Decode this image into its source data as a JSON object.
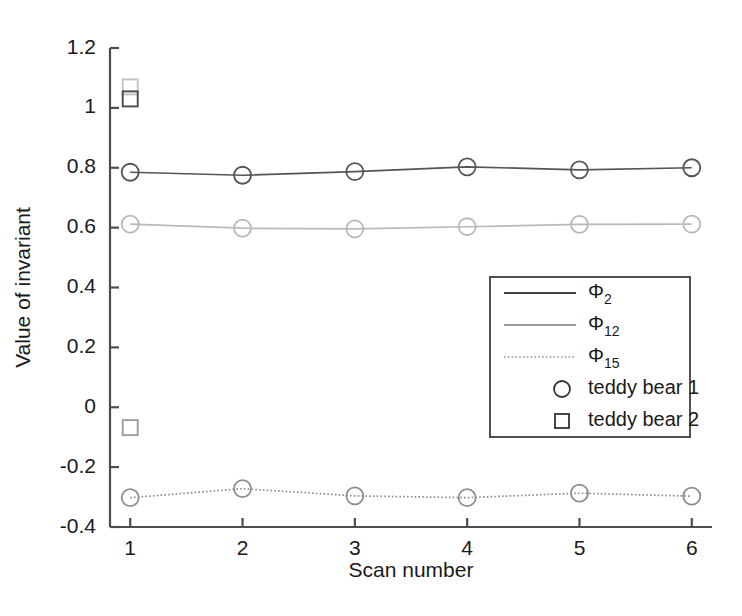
{
  "chart_data": {
    "type": "line",
    "title": "",
    "xlabel": "Scan number",
    "ylabel": "Value of invariant",
    "x": [
      1,
      2,
      3,
      4,
      5,
      6
    ],
    "xticklabels": [
      "1",
      "2",
      "3",
      "4",
      "5",
      "6"
    ],
    "yticklabels": [
      "1.2",
      "1",
      "0.8",
      "0.6",
      "0.4",
      "0.2",
      "0",
      "-0.2",
      "-0.4"
    ],
    "yticks": [
      1.2,
      1.0,
      0.8,
      0.6,
      0.4,
      0.2,
      0,
      -0.2,
      -0.4
    ],
    "xlim": [
      0.82,
      6.18
    ],
    "ylim": [
      -0.4,
      1.2
    ],
    "grid": false,
    "legend_position": "center-right",
    "series": [
      {
        "name": "Φ2",
        "label_base": "Φ",
        "label_sub": "2",
        "marker": "circle",
        "marker_series": "teddy bear 1",
        "linestyle": "solid",
        "color": "#555555",
        "values": [
          0.785,
          0.775,
          0.787,
          0.803,
          0.793,
          0.8
        ]
      },
      {
        "name": "Φ12",
        "label_base": "Φ",
        "label_sub": "12",
        "marker": "circle",
        "marker_series": "teddy bear 1",
        "linestyle": "solid",
        "color": "#b9b9b9",
        "values": [
          0.612,
          0.598,
          0.596,
          0.603,
          0.611,
          0.612
        ]
      },
      {
        "name": "Φ15",
        "label_base": "Φ",
        "label_sub": "15",
        "marker": "circle",
        "marker_series": "teddy bear 1",
        "linestyle": "dotted",
        "color": "#8d8d8d",
        "values": [
          -0.302,
          -0.272,
          -0.296,
          -0.302,
          -0.287,
          -0.297
        ]
      }
    ],
    "square_points": [
      {
        "series": "Φ2",
        "x": 1,
        "y": 1.07,
        "color": "#c2c2c2"
      },
      {
        "series": "Φ12",
        "x": 1,
        "y": 1.03,
        "color": "#4a4a4a"
      },
      {
        "series": "Φ15",
        "x": 1,
        "y": -0.068,
        "color": "#9d9d9d"
      }
    ],
    "legend": [
      {
        "kind": "line",
        "base": "Φ",
        "sub": "2",
        "text": "",
        "linestyle": "solid",
        "color": "#444444"
      },
      {
        "kind": "line",
        "base": "Φ",
        "sub": "12",
        "text": "",
        "linestyle": "solid",
        "color": "#9a9a9a"
      },
      {
        "kind": "line",
        "base": "Φ",
        "sub": "15",
        "text": "",
        "linestyle": "dotted",
        "color": "#b0b0b0"
      },
      {
        "kind": "marker",
        "base": "",
        "sub": "",
        "text": "teddy bear 1",
        "marker": "circle",
        "color": "#333333"
      },
      {
        "kind": "marker",
        "base": "",
        "sub": "",
        "text": "teddy bear 2",
        "marker": "square",
        "color": "#333333"
      }
    ],
    "axis_color": "#4d4d4d",
    "background": "#ffffff"
  }
}
